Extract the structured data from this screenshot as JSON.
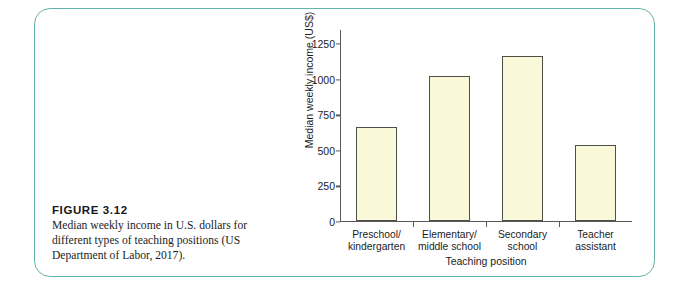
{
  "figure": {
    "caption_title": "FIGURE 3.12",
    "caption_text": "Median weekly income in U.S. dollars for different types of teaching positions (US Department of Labor, 2017).",
    "frame_color": "#66b2a6"
  },
  "chart_data": {
    "type": "bar",
    "title": "",
    "xlabel": "Teaching position",
    "ylabel": "Median weekly income (US$)",
    "categories": [
      "Preschool/\nkindergarten",
      "Elementary/\nmiddle school",
      "Secondary\nschool",
      "Teacher\nassistant"
    ],
    "category_labels": [
      {
        "line1": "Preschool/",
        "line2": "kindergarten"
      },
      {
        "line1": "Elementary/",
        "line2": "middle school"
      },
      {
        "line1": "Secondary",
        "line2": "school"
      },
      {
        "line1": "Teacher",
        "line2": "assistant"
      }
    ],
    "values": [
      660,
      1020,
      1155,
      535
    ],
    "ylim": [
      0,
      1350
    ],
    "yticks": [
      0,
      250,
      500,
      750,
      1000,
      1250
    ],
    "ytick_labels": [
      "0",
      "250",
      "500",
      "750",
      "1000",
      "1250"
    ],
    "grid": false,
    "legend": false,
    "bar_fill": "#f9f8d9",
    "bar_edge": "#4e4f45"
  }
}
